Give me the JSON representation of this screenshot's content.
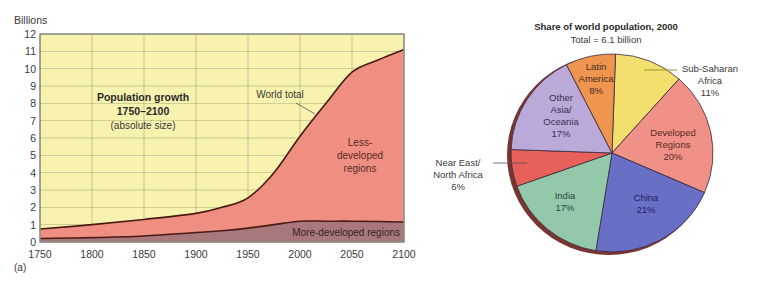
{
  "chart_data": [
    {
      "type": "area",
      "panel_label": "(a)",
      "title": "Population growth",
      "subtitle_years": "1750–2100",
      "subtitle_note": "(absolute size)",
      "ylabel": "Billions",
      "xlabel": "",
      "ylim": [
        0,
        12
      ],
      "xlim": [
        1750,
        2100
      ],
      "grid": true,
      "y_ticks": [
        "0",
        "1",
        "2",
        "3",
        "4",
        "5",
        "6",
        "7",
        "8",
        "9",
        "10",
        "11",
        "12"
      ],
      "x_ticks": [
        "1750",
        "1800",
        "1850",
        "1900",
        "1950",
        "2000",
        "2050",
        "2100"
      ],
      "x": [
        1750,
        1800,
        1850,
        1900,
        1925,
        1950,
        1975,
        2000,
        2025,
        2050,
        2075,
        2100
      ],
      "series": [
        {
          "name": "More-developed regions",
          "values": [
            0.2,
            0.25,
            0.35,
            0.55,
            0.65,
            0.8,
            1.0,
            1.2,
            1.2,
            1.2,
            1.18,
            1.15
          ]
        },
        {
          "name": "World total",
          "values": [
            0.75,
            1.0,
            1.3,
            1.65,
            2.0,
            2.55,
            4.0,
            6.1,
            8.0,
            9.8,
            10.5,
            11.1
          ]
        }
      ],
      "annotations": [
        "World total",
        "Less-developed regions",
        "More-developed regions"
      ],
      "annotation_lines": {
        "less_1": "Less-",
        "less_2": "developed",
        "less_3": "regions"
      }
    },
    {
      "type": "pie",
      "title": "Share of world population, 2000",
      "subtitle": "Total = 6.1 billion",
      "slices": [
        {
          "label": "Sub-Saharan Africa",
          "value": 11,
          "color": "#f3df6e"
        },
        {
          "label": "Developed Regions",
          "value": 20,
          "color": "#ef9186"
        },
        {
          "label": "China",
          "value": 21,
          "color": "#6a6fc6"
        },
        {
          "label": "India",
          "value": 17,
          "color": "#93c8ab"
        },
        {
          "label": "Near East/ North Africa",
          "value": 6,
          "color": "#e7605a"
        },
        {
          "label": "Other Asia/ Oceania",
          "value": 17,
          "color": "#bba9d9"
        },
        {
          "label": "Latin America",
          "value": 8,
          "color": "#ee9550"
        }
      ]
    }
  ],
  "colors": {
    "plot_bg": "#f7f3ae",
    "less_developed": "#ef8f82",
    "more_developed": "#a8787a",
    "line": "#4a1a14",
    "grid": "#8a8a6a",
    "pie_shadow": "#7a3530"
  },
  "labels": {
    "pie_ssa": [
      "Sub-Saharan",
      "Africa",
      "11%"
    ],
    "pie_dev": [
      "Developed",
      "Regions",
      "20%"
    ],
    "pie_china": [
      "China",
      "21%"
    ],
    "pie_india": [
      "India",
      "17%"
    ],
    "pie_ne": [
      "Near East/",
      "North Africa",
      "6%"
    ],
    "pie_other": [
      "Other",
      "Asia/",
      "Oceania",
      "17%"
    ],
    "pie_latin": [
      "Latin",
      "America",
      "8%"
    ]
  }
}
